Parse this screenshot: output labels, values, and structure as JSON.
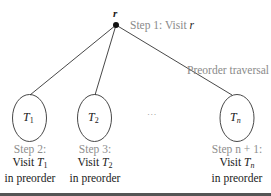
{
  "diagram": {
    "root": {
      "label": "r",
      "step_text": "Step 1: Visit ",
      "step_var": "r"
    },
    "traversal_label": "Preorder traversal",
    "ellipsis": "· · ·",
    "subtrees": [
      {
        "name": "T",
        "sub": "1",
        "step": "Step 2:",
        "visit": "Visit ",
        "visit_var": "T",
        "visit_sub": "1",
        "order": "in preorder"
      },
      {
        "name": "T",
        "sub": "2",
        "step": "Step 3:",
        "visit": "Visit ",
        "visit_var": "T",
        "visit_sub": "2",
        "order": "in preorder"
      },
      {
        "name": "T",
        "sub": "n",
        "step": "Step n + 1:",
        "visit": "Visit ",
        "visit_var": "T",
        "visit_sub": "n",
        "order": "in preorder"
      }
    ],
    "colors": {
      "line": "#333333",
      "step_label": "#8e8e8e",
      "text": "#1a1a1a",
      "bar": "#555555"
    }
  }
}
